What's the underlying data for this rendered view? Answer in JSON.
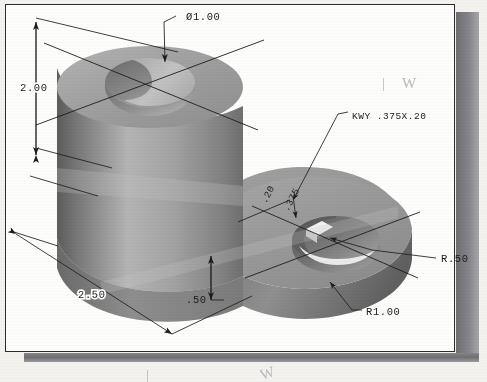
{
  "drawing": {
    "type": "isometric-pictorial",
    "subject": "two-lobe base plate with bored boss and keyed hole",
    "background_color": "#f3f2ef",
    "sheet_color": "#fdfdfb",
    "line_color": "#1d1d1d"
  },
  "dimensions": [
    {
      "id": "bore-diameter",
      "label": "Ø1.00",
      "kind": "diameter-callout",
      "target": "top bore of tall cylinder"
    },
    {
      "id": "overall-height",
      "label": "2.00",
      "kind": "linear-vertical",
      "target": "cylinder height"
    },
    {
      "id": "plate-length",
      "label": "2.50",
      "kind": "linear-isometric",
      "target": "base plate length"
    },
    {
      "id": "plate-thickness",
      "label": ".50",
      "kind": "linear-vertical",
      "target": "base plate thickness"
    },
    {
      "id": "keyway-note",
      "label": "KWY .375X.20",
      "kind": "leader-note",
      "target": "keyway in right hole"
    },
    {
      "id": "keyway-depth",
      "label": ".20",
      "kind": "linear-isometric",
      "target": "keyway depth"
    },
    {
      "id": "keyway-width",
      "label": ".375",
      "kind": "linear-isometric",
      "target": "keyway width"
    },
    {
      "id": "hole-radius",
      "label": "R.50",
      "kind": "radius-callout",
      "target": "right through hole"
    },
    {
      "id": "boss-radius",
      "label": "R1.00",
      "kind": "radius-callout",
      "target": "right lobe outer radius"
    }
  ],
  "annotations": {
    "pencil_mark_bar": "|",
    "pencil_mark_w": "W"
  },
  "colors": {
    "shadow_dark": "#6e6e72",
    "shadow_light": "#a6a6aa",
    "surface_top": "#9b9b9b",
    "surface_front": "#8a8a8a",
    "surface_right": "#6f6f6f"
  }
}
